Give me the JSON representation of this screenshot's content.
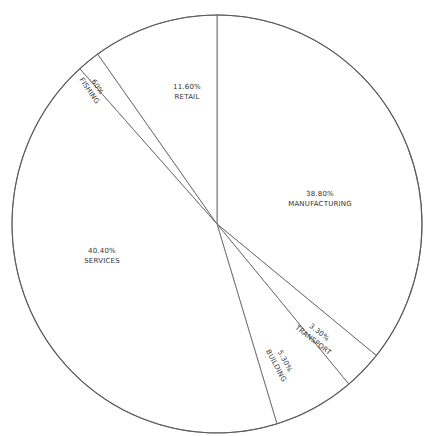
{
  "chart_data": {
    "type": "pie",
    "title": "",
    "categories": [
      "MANUFACTURING",
      "TRANSPORT",
      "BUILDING",
      "SERVICES",
      "FISHING",
      "RETAIL"
    ],
    "values": [
      38.8,
      3.3,
      5.3,
      40.4,
      0.6,
      11.6
    ],
    "unit": "%",
    "labels": [
      {
        "value_text": "38.80%",
        "name": "MANUFACTURING"
      },
      {
        "value_text": "3.30%",
        "name": "TRANSPORT"
      },
      {
        "value_text": "5.30%",
        "name": "BUILDING"
      },
      {
        "value_text": "40.40%",
        "name": "SERVICES"
      },
      {
        "value_text": ".60%",
        "name": "FISHING"
      },
      {
        "value_text": "11.60%",
        "name": "RETAIL"
      }
    ],
    "start_angle_deg": 0,
    "direction": "clockwise",
    "legend": "none",
    "grid": false
  },
  "render": {
    "cx": 217,
    "cy": 224,
    "rx": 205,
    "ry": 209,
    "slices": [
      {
        "name": "manufacturing",
        "start": 0,
        "end": 129,
        "label_x": 320,
        "label_y": 196,
        "rotate": 0
      },
      {
        "name": "transport",
        "start": 129,
        "end": 140,
        "label_x": 318,
        "label_y": 334,
        "rotate": 38
      },
      {
        "name": "building",
        "start": 140,
        "end": 163,
        "label_x": 283,
        "label_y": 362,
        "rotate": 62
      },
      {
        "name": "services",
        "start": 163,
        "end": 318,
        "label_x": 102,
        "label_y": 253,
        "rotate": 0
      },
      {
        "name": "fishing",
        "start": 318,
        "end": 324.4,
        "label_x": 95,
        "label_y": 87,
        "rotate": 56
      },
      {
        "name": "retail",
        "start": 324.4,
        "end": 360,
        "label_x": 187,
        "label_y": 89,
        "rotate": 0
      }
    ],
    "colors": {
      "stroke": "#6a6a6a",
      "text": "#333333",
      "background": "#ffffff"
    }
  }
}
